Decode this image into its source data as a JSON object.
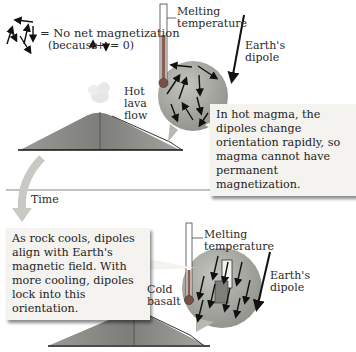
{
  "legend": {
    "label": "= No net magnetization",
    "because_prefix": "(because",
    "because_suffix": "= 0)",
    "plus": "+"
  },
  "top_panel": {
    "thermometer_label_line1": "Melting",
    "thermometer_label_line2": "temperature",
    "dipole_label_line1": "Earth's",
    "dipole_label_line2": "dipole",
    "lava_label_line1": "Hot",
    "lava_label_line2": "lava",
    "lava_label_line3": "flow",
    "callout_text": "In hot magma, the dipoles change orientation rapidly, so magma cannot have permanent magnetization."
  },
  "time_label": "Time",
  "bottom_panel": {
    "callout_text": "As rock cools, dipoles align with Earth's magnetic field. With more cooling, dipoles lock into this orientation.",
    "basalt_label_line1": "Cold",
    "basalt_label_line2": "basalt",
    "thermometer_label_line1": "Melting",
    "thermometer_label_line2": "temperature",
    "dipole_label_line1": "Earth's",
    "dipole_label_line2": "dipole"
  },
  "colors": {
    "sphere_fill": "#a9aba3",
    "volcano_fill": "#8c8c88",
    "callout_bg": "#f4f3ef",
    "time_arrow": "#c7c9c2"
  }
}
